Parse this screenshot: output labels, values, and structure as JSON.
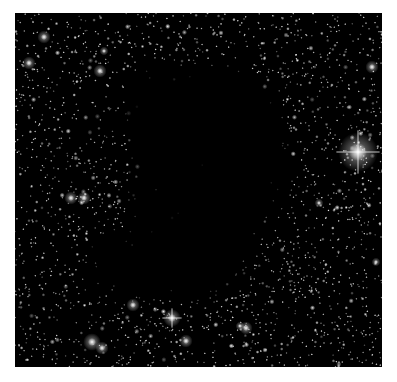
{
  "image": {
    "subject": "Dark nebula (Bok globule) silhouetted against a dense star field",
    "background_color": "#ffffff",
    "frame": {
      "x": 15,
      "y": 13,
      "width": 367,
      "height": 354,
      "color": "#000000"
    },
    "dark_cloud_polygon": [
      [
        128,
        75
      ],
      [
        170,
        62
      ],
      [
        215,
        60
      ],
      [
        252,
        70
      ],
      [
        270,
        95
      ],
      [
        290,
        130
      ],
      [
        292,
        170
      ],
      [
        282,
        205
      ],
      [
        262,
        235
      ],
      [
        252,
        262
      ],
      [
        240,
        290
      ],
      [
        200,
        300
      ],
      [
        150,
        300
      ],
      [
        105,
        292
      ],
      [
        85,
        272
      ],
      [
        90,
        248
      ],
      [
        110,
        235
      ],
      [
        127,
        225
      ],
      [
        128,
        180
      ],
      [
        126,
        130
      ],
      [
        125,
        95
      ]
    ],
    "bright_stars": [
      {
        "x": 358,
        "y": 152,
        "r": 9,
        "spikes": true
      },
      {
        "x": 172,
        "y": 318,
        "r": 4,
        "spikes": true
      },
      {
        "x": 92,
        "y": 342,
        "r": 4,
        "spikes": false
      },
      {
        "x": 102,
        "y": 348,
        "r": 3,
        "spikes": false
      },
      {
        "x": 186,
        "y": 341,
        "r": 3,
        "spikes": false
      },
      {
        "x": 133,
        "y": 305,
        "r": 3,
        "spikes": false
      },
      {
        "x": 246,
        "y": 328,
        "r": 3,
        "spikes": false
      },
      {
        "x": 240,
        "y": 326,
        "r": 2,
        "spikes": false
      },
      {
        "x": 71,
        "y": 198,
        "r": 3,
        "spikes": false
      },
      {
        "x": 84,
        "y": 198,
        "r": 3,
        "spikes": false
      },
      {
        "x": 44,
        "y": 37,
        "r": 3,
        "spikes": false
      },
      {
        "x": 29,
        "y": 63,
        "r": 3,
        "spikes": false
      },
      {
        "x": 100,
        "y": 71,
        "r": 3,
        "spikes": false
      },
      {
        "x": 372,
        "y": 67,
        "r": 3,
        "spikes": false
      },
      {
        "x": 319,
        "y": 203,
        "r": 2,
        "spikes": false
      },
      {
        "x": 376,
        "y": 262,
        "r": 2,
        "spikes": false
      },
      {
        "x": 104,
        "y": 51,
        "r": 2,
        "spikes": false
      }
    ],
    "field_star_count": 2600,
    "seed": 1337
  }
}
